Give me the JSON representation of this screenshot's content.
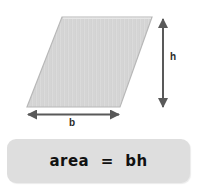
{
  "figure": {
    "background_color": "#ffffff"
  },
  "shape": {
    "name": "parallelogram",
    "fill_color": "#d4d4d4",
    "stroke_color": "#b4b4b4",
    "vertices": [
      {
        "x": 62,
        "y": 17
      },
      {
        "x": 152,
        "y": 17
      },
      {
        "x": 120,
        "y": 107
      },
      {
        "x": 27,
        "y": 107
      }
    ]
  },
  "dimensions": {
    "base": {
      "label": "b",
      "arrow_color": "#595959",
      "orientation": "horizontal",
      "from": {
        "x": 27,
        "y": 114
      },
      "to": {
        "x": 120,
        "y": 114
      }
    },
    "height": {
      "label": "h",
      "arrow_color": "#595959",
      "orientation": "vertical",
      "from": {
        "x": 163,
        "y": 18
      },
      "to": {
        "x": 163,
        "y": 108
      }
    }
  },
  "formula": {
    "text": "area  =  bh",
    "box_color": "#dedede",
    "text_color": "#111111"
  }
}
